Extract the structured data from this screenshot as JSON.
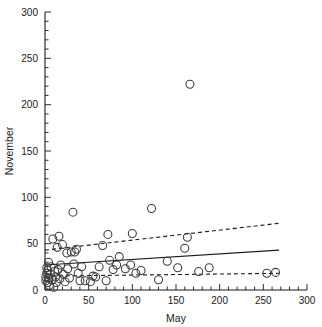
{
  "chart_data": {
    "type": "scatter",
    "title": "",
    "xlabel": "May",
    "ylabel": "November",
    "xlim": [
      0,
      300
    ],
    "ylim": [
      0,
      300
    ],
    "xticks": [
      0,
      50,
      100,
      150,
      200,
      250,
      300
    ],
    "yticks": [
      0,
      50,
      100,
      150,
      200,
      250,
      300
    ],
    "xtick_labels": [
      "0",
      "50",
      "100",
      "150",
      "200",
      "250",
      "300"
    ],
    "ytick_labels": [
      "0",
      "50",
      "100",
      "150",
      "200",
      "250",
      "300"
    ],
    "xminor_step": 10,
    "yminor_step": 10,
    "grid": false,
    "legend": null,
    "marker": "open-circle",
    "marker_color": "#3a3a3a",
    "marker_size": 5,
    "points": [
      {
        "x": 1,
        "y": 10
      },
      {
        "x": 1,
        "y": 14
      },
      {
        "x": 2,
        "y": 18
      },
      {
        "x": 2,
        "y": 24
      },
      {
        "x": 3,
        "y": 8
      },
      {
        "x": 3,
        "y": 21
      },
      {
        "x": 4,
        "y": 13
      },
      {
        "x": 4,
        "y": 30
      },
      {
        "x": 5,
        "y": 5
      },
      {
        "x": 6,
        "y": 17
      },
      {
        "x": 7,
        "y": 25
      },
      {
        "x": 8,
        "y": 11
      },
      {
        "x": 9,
        "y": 55
      },
      {
        "x": 10,
        "y": 3
      },
      {
        "x": 11,
        "y": 20
      },
      {
        "x": 12,
        "y": 14
      },
      {
        "x": 13,
        "y": 8
      },
      {
        "x": 14,
        "y": 46
      },
      {
        "x": 15,
        "y": 22
      },
      {
        "x": 16,
        "y": 58
      },
      {
        "x": 17,
        "y": 12
      },
      {
        "x": 18,
        "y": 27
      },
      {
        "x": 20,
        "y": 49
      },
      {
        "x": 21,
        "y": 17
      },
      {
        "x": 23,
        "y": 9
      },
      {
        "x": 25,
        "y": 40
      },
      {
        "x": 26,
        "y": 23
      },
      {
        "x": 28,
        "y": 13
      },
      {
        "x": 30,
        "y": 41
      },
      {
        "x": 32,
        "y": 84
      },
      {
        "x": 33,
        "y": 28
      },
      {
        "x": 34,
        "y": 41
      },
      {
        "x": 36,
        "y": 44
      },
      {
        "x": 38,
        "y": 18
      },
      {
        "x": 40,
        "y": 10
      },
      {
        "x": 42,
        "y": 25
      },
      {
        "x": 46,
        "y": 10
      },
      {
        "x": 52,
        "y": 9
      },
      {
        "x": 55,
        "y": 15
      },
      {
        "x": 58,
        "y": 14
      },
      {
        "x": 62,
        "y": 25
      },
      {
        "x": 66,
        "y": 48
      },
      {
        "x": 70,
        "y": 10
      },
      {
        "x": 72,
        "y": 60
      },
      {
        "x": 74,
        "y": 32
      },
      {
        "x": 78,
        "y": 22
      },
      {
        "x": 82,
        "y": 27
      },
      {
        "x": 85,
        "y": 36
      },
      {
        "x": 92,
        "y": 23
      },
      {
        "x": 98,
        "y": 27
      },
      {
        "x": 100,
        "y": 61
      },
      {
        "x": 104,
        "y": 18
      },
      {
        "x": 110,
        "y": 21
      },
      {
        "x": 122,
        "y": 88
      },
      {
        "x": 130,
        "y": 11
      },
      {
        "x": 140,
        "y": 31
      },
      {
        "x": 152,
        "y": 24
      },
      {
        "x": 160,
        "y": 45
      },
      {
        "x": 163,
        "y": 57
      },
      {
        "x": 166,
        "y": 222
      },
      {
        "x": 176,
        "y": 20
      },
      {
        "x": 188,
        "y": 24
      },
      {
        "x": 254,
        "y": 18
      },
      {
        "x": 264,
        "y": 19
      }
    ],
    "lines": [
      {
        "name": "regression-line",
        "style": "solid",
        "color": "#1a1a1a",
        "x_start": 0,
        "y_start": 27,
        "x_end": 268,
        "y_end": 43
      },
      {
        "name": "upper-confidence-band",
        "style": "dashed",
        "color": "#1a1a1a",
        "x_start": 0,
        "y_start": 43,
        "x_end": 268,
        "y_end": 72
      },
      {
        "name": "lower-confidence-band",
        "style": "dashed",
        "color": "#1a1a1a",
        "x_start": 0,
        "y_start": 15,
        "x_end": 268,
        "y_end": 18
      }
    ]
  }
}
